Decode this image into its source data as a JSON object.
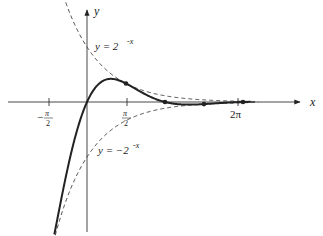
{
  "figure": {
    "axes": {
      "x_label": "x",
      "y_label": "y",
      "x_ticks": [
        {
          "label_num": "π",
          "label_den": "2",
          "sign": "−",
          "value": -1.5708
        },
        {
          "label_num": "π",
          "label_den": "2",
          "sign": "",
          "value": 1.5708
        },
        {
          "label": "2π",
          "value": 6.2832
        }
      ]
    },
    "curves": [
      {
        "name": "main-curve",
        "expression": "y = 2^-x sin x",
        "style": "solid"
      },
      {
        "name": "upper-envelope",
        "label_prefix": "y = 2",
        "label_exp": "-x",
        "style": "dashed"
      },
      {
        "name": "lower-envelope",
        "label_prefix": "y = −2",
        "label_exp": "-x",
        "style": "dashed"
      }
    ],
    "colors": {
      "line": "#222222",
      "background": "#ffffff"
    }
  },
  "chart_data": {
    "type": "line",
    "title": "",
    "xlabel": "x",
    "ylabel": "y",
    "xlim": [
      -2.2,
      7.2
    ],
    "ylim": [
      -2.4,
      1.8
    ],
    "x_tick_labels": [
      "−π/2",
      "π/2",
      "2π"
    ],
    "series": [
      {
        "name": "y = 2^-x sin x",
        "style": "solid",
        "points": [
          [
            -2.0,
            -3.64
          ],
          [
            -1.5708,
            -2.97
          ],
          [
            -1.0,
            -1.68
          ],
          [
            0,
            0
          ],
          [
            0.5,
            0.34
          ],
          [
            1.0,
            0.42
          ],
          [
            1.5708,
            0.34
          ],
          [
            2.0,
            0.23
          ],
          [
            3.1416,
            0.0
          ],
          [
            4.0,
            -0.047
          ],
          [
            4.7124,
            -0.038
          ],
          [
            6.2832,
            0.0
          ]
        ],
        "marked_points": [
          [
            -1.33,
            -2.5
          ],
          [
            1.5708,
            0.337
          ],
          [
            3.1416,
            0
          ],
          [
            4.7124,
            -0.038
          ],
          [
            6.2832,
            0
          ]
        ]
      },
      {
        "name": "y = 2^-x",
        "style": "dashed",
        "points": [
          [
            -1.5,
            2.83
          ],
          [
            -1.0,
            2.0
          ],
          [
            0,
            1.0
          ],
          [
            1.0,
            0.5
          ],
          [
            1.5708,
            0.337
          ],
          [
            3.1416,
            0.113
          ],
          [
            4.7124,
            0.038
          ],
          [
            6.2832,
            0.013
          ],
          [
            7.0,
            0.008
          ]
        ]
      },
      {
        "name": "y = -2^-x",
        "style": "dashed",
        "points": [
          [
            -1.5,
            -2.83
          ],
          [
            -1.0,
            -2.0
          ],
          [
            0,
            -1.0
          ],
          [
            1.0,
            -0.5
          ],
          [
            1.5708,
            -0.337
          ],
          [
            3.1416,
            -0.113
          ],
          [
            4.7124,
            -0.038
          ],
          [
            6.2832,
            -0.013
          ],
          [
            7.0,
            -0.008
          ]
        ]
      }
    ],
    "annotations": [
      "y = 2^-x",
      "y = −2^-x"
    ],
    "grid": false,
    "legend": "none"
  }
}
